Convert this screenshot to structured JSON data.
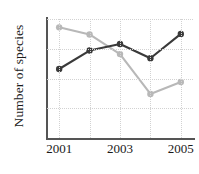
{
  "chart_data": {
    "type": "line",
    "title": "",
    "xlabel": "",
    "ylabel": "Number of species",
    "x": [
      2001,
      2002,
      2003,
      2004,
      2005
    ],
    "categories": [
      "2001",
      "2002",
      "2003",
      "2004",
      "2005"
    ],
    "xtick_labels": [
      "2001",
      "2003",
      "2005"
    ],
    "xtick_values": [
      2001,
      2003,
      2005
    ],
    "ytick_labels": [
      "0",
      "10",
      "15",
      "20"
    ],
    "ytick_values": [
      0,
      10,
      15,
      20
    ],
    "ylim": [
      0,
      20
    ],
    "xlim": [
      2000.6,
      2005.4
    ],
    "grid": true,
    "grid_style": "dotted",
    "grid_color": "#d2d2d2",
    "legend": "none",
    "series": [
      {
        "name": "dark-series",
        "color": "#3a3a3a",
        "values": [
          11.6,
          14.7,
          15.8,
          13.4,
          17.5
        ]
      },
      {
        "name": "light-series",
        "color": "#b8b8b8",
        "values": [
          18.6,
          17.4,
          14.1,
          7.4,
          9.4
        ]
      }
    ],
    "axis_color": "#555555",
    "marker": "circle",
    "marker_size": 5.2,
    "line_width": 2.1
  }
}
